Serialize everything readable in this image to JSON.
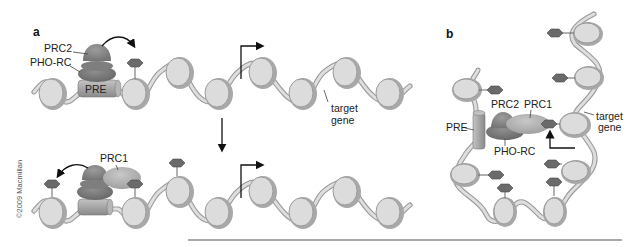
{
  "figure": {
    "copyright": "©2009 Macmillan",
    "colors": {
      "dna": "#9a9a9a",
      "nucleosome": "#dcdcdc",
      "methyl_mark": "#6a6a6a",
      "prc2": "#8a8a8a",
      "pho_rc": "#7c7c7c",
      "prc1": "#b4b4b4",
      "pre": "#a0a0a0",
      "rule": "#555555"
    }
  },
  "panel_a": {
    "label": "a",
    "top": {
      "labels": {
        "prc2": "PRC2",
        "pho_rc": "PHO-RC",
        "pre": "PRE",
        "target_gene_line1": "target",
        "target_gene_line2": "gene"
      },
      "arrows": [
        "curved-arrow PRC2 to histone mark",
        "transcription-start arrow"
      ]
    },
    "transition_arrow": "down-arrow",
    "bottom": {
      "labels": {
        "prc1": "PRC1"
      },
      "arrows": [
        "curved-arrow PRC1 to histone mark",
        "transcription-start arrow"
      ]
    }
  },
  "panel_b": {
    "label": "b",
    "labels": {
      "pre": "PRE",
      "prc2": "PRC2",
      "prc1": "PRC1",
      "pho_rc": "PHO-RC",
      "target_gene_line1": "target",
      "target_gene_line2": "gene"
    },
    "arrows": [
      "transcription-start arrow pointing up to PRC1 mark"
    ]
  }
}
